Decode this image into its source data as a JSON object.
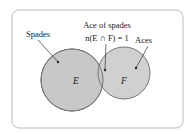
{
  "diagram": {
    "type": "venn",
    "sets": [
      {
        "id": "E",
        "symbol": "E",
        "label": "Spades"
      },
      {
        "id": "F",
        "symbol": "F",
        "label": "Aces"
      }
    ],
    "intersection": {
      "title": "Ace of spades",
      "formula": "n(E ∩ F) = 1"
    },
    "colors": {
      "fill": "#c8c8c8",
      "stroke": "#777777",
      "frame": "#bbbbbb"
    }
  }
}
